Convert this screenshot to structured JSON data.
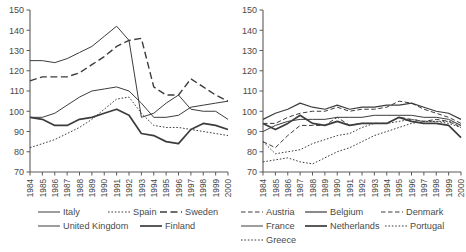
{
  "figure": {
    "panels": [
      {
        "id": "left",
        "name": "chart-left",
        "legend_rows": [
          [
            {
              "label": "Italy",
              "style": "solid",
              "width": 1.0
            },
            {
              "label": "Spain",
              "style": "dotted",
              "width": 1.0
            },
            {
              "label": "Sweden",
              "style": "dashed",
              "width": 1.4
            }
          ],
          [
            {
              "label": "United Kingdom",
              "style": "solid",
              "width": 1.0
            },
            {
              "label": "Finland",
              "style": "solid",
              "width": 1.7
            }
          ]
        ]
      },
      {
        "id": "right",
        "name": "chart-right",
        "legend_rows": [
          [
            {
              "label": "Austria",
              "style": "dashed",
              "width": 1.0
            },
            {
              "label": "Belgium",
              "style": "solid",
              "width": 1.2
            },
            {
              "label": "Denmark",
              "style": "dashed",
              "width": 1.0
            }
          ],
          [
            {
              "label": "France",
              "style": "solid",
              "width": 1.0
            },
            {
              "label": "Netherlands",
              "style": "solid",
              "width": 1.7
            },
            {
              "label": "Portugal",
              "style": "dotted",
              "width": 1.0
            }
          ],
          [
            {
              "label": "Greece",
              "style": "dotted",
              "width": 1.0
            }
          ]
        ]
      }
    ]
  },
  "chart_data": [
    {
      "type": "line",
      "title": "",
      "xlabel": "",
      "ylabel": "",
      "panel": "left",
      "grid": false,
      "legend_position": "below",
      "xlim": [
        1984,
        2000
      ],
      "ylim": [
        70,
        150
      ],
      "yticks": [
        70,
        80,
        90,
        100,
        110,
        120,
        130,
        140,
        150
      ],
      "x": [
        1984,
        1985,
        1986,
        1987,
        1988,
        1989,
        1990,
        1991,
        1992,
        1993,
        1994,
        1995,
        1996,
        1997,
        1998,
        1999,
        2000
      ],
      "series": [
        {
          "name": "Italy",
          "style": "solid",
          "width": 1.0,
          "values": [
            125,
            125,
            124,
            126,
            129,
            132,
            137,
            142,
            135,
            97,
            99,
            104,
            108,
            101,
            100,
            100,
            96
          ]
        },
        {
          "name": "Spain",
          "style": "dotted",
          "width": 1.0,
          "values": [
            82,
            84,
            86,
            89,
            92,
            96,
            101,
            106,
            107,
            99,
            93,
            92,
            92,
            91,
            90,
            89,
            88
          ]
        },
        {
          "name": "Sweden",
          "style": "dashed",
          "width": 1.4,
          "values": [
            115,
            117,
            117,
            117,
            119,
            123,
            127,
            132,
            135,
            136,
            112,
            108,
            108,
            116,
            112,
            108,
            105
          ]
        },
        {
          "name": "United Kingdom",
          "style": "solid",
          "width": 1.0,
          "values": [
            97,
            97,
            99,
            103,
            107,
            110,
            111,
            112,
            110,
            104,
            97,
            97,
            98,
            102,
            103,
            104,
            105
          ]
        },
        {
          "name": "Finland",
          "style": "solid",
          "width": 1.7,
          "values": [
            97,
            96,
            93,
            93,
            96,
            97,
            99,
            101,
            98,
            89,
            88,
            85,
            84,
            91,
            94,
            93,
            91
          ]
        }
      ]
    },
    {
      "type": "line",
      "title": "",
      "xlabel": "",
      "ylabel": "",
      "panel": "right",
      "grid": false,
      "legend_position": "below",
      "xlim": [
        1984,
        2000
      ],
      "ylim": [
        70,
        150
      ],
      "yticks": [
        70,
        80,
        90,
        100,
        110,
        120,
        130,
        140,
        150
      ],
      "x": [
        1984,
        1985,
        1986,
        1987,
        1988,
        1989,
        1990,
        1991,
        1992,
        1993,
        1994,
        1995,
        1996,
        1997,
        1998,
        1999,
        2000
      ],
      "series": [
        {
          "name": "Austria",
          "style": "dashed",
          "width": 1.0,
          "values": [
            94,
            94,
            97,
            99,
            100,
            100,
            102,
            100,
            101,
            101,
            102,
            105,
            104,
            101,
            99,
            97,
            94
          ]
        },
        {
          "name": "Belgium",
          "style": "solid",
          "width": 1.2,
          "values": [
            96,
            99,
            101,
            104,
            102,
            101,
            103,
            101,
            102,
            102,
            103,
            103,
            104,
            102,
            100,
            99,
            96
          ]
        },
        {
          "name": "Denmark",
          "style": "dashed",
          "width": 1.0,
          "values": [
            85,
            82,
            88,
            93,
            93,
            93,
            97,
            93,
            94,
            94,
            94,
            97,
            96,
            95,
            96,
            95,
            92
          ]
        },
        {
          "name": "France",
          "style": "solid",
          "width": 1.0,
          "values": [
            90,
            93,
            95,
            96,
            96,
            96,
            97,
            97,
            97,
            98,
            98,
            98,
            98,
            97,
            97,
            96,
            93
          ]
        },
        {
          "name": "Netherlands",
          "style": "solid",
          "width": 1.7,
          "values": [
            94,
            91,
            94,
            98,
            94,
            93,
            95,
            93,
            94,
            94,
            94,
            97,
            95,
            94,
            94,
            93,
            87
          ]
        },
        {
          "name": "Portugal",
          "style": "dotted",
          "width": 1.0,
          "values": [
            85,
            79,
            80,
            81,
            84,
            86,
            88,
            89,
            92,
            94,
            94,
            95,
            96,
            95,
            95,
            95,
            93
          ]
        },
        {
          "name": "Greece",
          "style": "dotted",
          "width": 1.0,
          "values": [
            75,
            76,
            77,
            75,
            74,
            77,
            80,
            82,
            85,
            88,
            90,
            92,
            94,
            95,
            95,
            94,
            92
          ]
        }
      ]
    }
  ]
}
